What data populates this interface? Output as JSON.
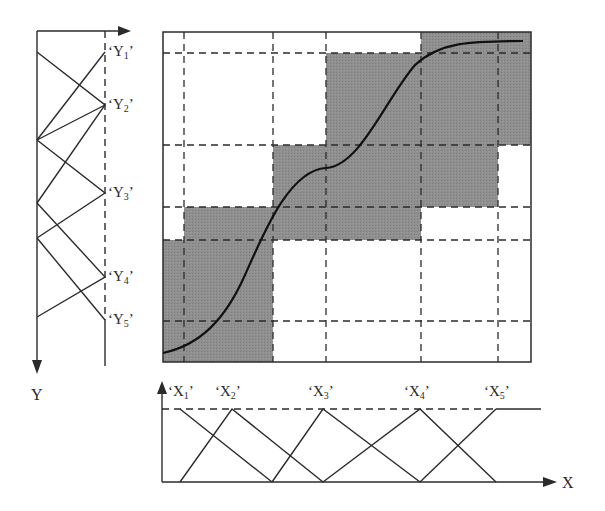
{
  "diagram": {
    "type": "fuzzy-rule-patch-approximation",
    "colors": {
      "shade": "#8c8c8c",
      "line": "#2b2b2b",
      "background": "#ffffff"
    },
    "grid": {
      "left": 163,
      "top": 32,
      "right": 531,
      "bottom": 362,
      "vertical_dashed_x": [
        184,
        273,
        326,
        421,
        498
      ],
      "horizontal_dashed_y": [
        53,
        145,
        207,
        240,
        321
      ]
    },
    "shaded_patches": [
      {
        "x1": 163,
        "y1": 240,
        "x2": 273,
        "y2": 362
      },
      {
        "x1": 184,
        "y1": 207,
        "x2": 421,
        "y2": 240
      },
      {
        "x1": 273,
        "y1": 145,
        "x2": 498,
        "y2": 207
      },
      {
        "x1": 326,
        "y1": 53,
        "x2": 531,
        "y2": 145
      },
      {
        "x1": 421,
        "y1": 32,
        "x2": 531,
        "y2": 53
      }
    ],
    "curve_path": "M163,353 C200,345 225,320 245,275 C265,230 290,170 326,168 C360,166 385,100 415,65 C440,42 470,41 523,41",
    "y_axis": {
      "label": "Y",
      "sets": [
        {
          "name": "Y",
          "sub": "1",
          "y": 52
        },
        {
          "name": "Y",
          "sub": "2",
          "y": 105
        },
        {
          "name": "Y",
          "sub": "3",
          "y": 193
        },
        {
          "name": "Y",
          "sub": "4",
          "y": 277
        },
        {
          "name": "Y",
          "sub": "5",
          "y": 320
        }
      ]
    },
    "x_axis": {
      "label": "X",
      "sets": [
        {
          "name": "X",
          "sub": "1",
          "x": 180
        },
        {
          "name": "X",
          "sub": "2",
          "x": 232
        },
        {
          "name": "X",
          "sub": "3",
          "x": 323
        },
        {
          "name": "X",
          "sub": "4",
          "x": 420
        },
        {
          "name": "X",
          "sub": "5",
          "x": 496
        }
      ]
    }
  },
  "labels": {
    "y1": "Y",
    "y1_sub": "1",
    "y2": "Y",
    "y2_sub": "2",
    "y3": "Y",
    "y3_sub": "3",
    "y4": "Y",
    "y4_sub": "4",
    "y5": "Y",
    "y5_sub": "5",
    "x1": "X",
    "x1_sub": "1",
    "x2": "X",
    "x2_sub": "2",
    "x3": "X",
    "x3_sub": "3",
    "x4": "X",
    "x4_sub": "4",
    "x5": "X",
    "x5_sub": "5",
    "y_axis": "Y",
    "x_axis": "X",
    "open_quote": "‘",
    "close_quote": "’"
  }
}
